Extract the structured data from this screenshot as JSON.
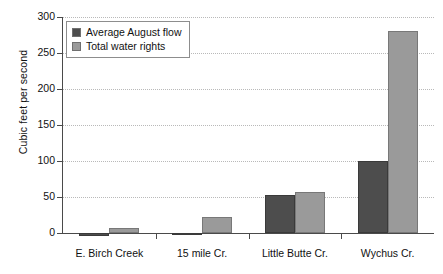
{
  "chart_data": {
    "type": "bar",
    "title": "",
    "xlabel": "",
    "ylabel": "Cubic feet per second",
    "ylim": [
      0,
      300
    ],
    "yticks": [
      0,
      50,
      100,
      150,
      200,
      250,
      300
    ],
    "grid": true,
    "legend_position": "top-left inside plot",
    "categories": [
      "E. Birch Creek",
      "15 mile Cr.",
      "Little Butte Cr.",
      "Wychus Cr."
    ],
    "series": [
      {
        "name": "Average August flow",
        "color": "#4d4d4d",
        "values": [
          -4,
          -3,
          53,
          100
        ]
      },
      {
        "name": "Total water rights",
        "color": "#9a9a9a",
        "values": [
          7,
          22,
          57,
          280
        ]
      }
    ]
  },
  "axis": {
    "y_title": "Cubic feet per second",
    "y_tick_labels": [
      "300",
      "250",
      "200",
      "150",
      "100",
      "50",
      "0"
    ],
    "x_tick_labels": [
      "E. Birch Creek",
      "15 mile Cr.",
      "Little Butte Cr.",
      "Wychus Cr."
    ]
  },
  "legend": {
    "entries": [
      {
        "label": "Average August flow",
        "swatch": "dark"
      },
      {
        "label": "Total water rights",
        "swatch": "light"
      }
    ]
  },
  "colors": {
    "series_dark": "#4d4d4d",
    "series_light": "#9a9a9a",
    "gridline": "#b9b9b9",
    "axis": "#4a4a4a",
    "background": "#ffffff"
  }
}
